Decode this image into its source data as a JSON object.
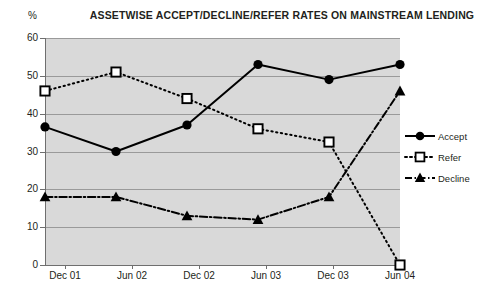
{
  "chart_data": {
    "type": "line",
    "title": "ASSETWISE ACCEPT/DECLINE/REFER RATES ON MAINSTREAM LENDING",
    "xlabel": "",
    "ylabel": "%",
    "categories": [
      "Dec 01",
      "Jun 02",
      "Dec 02",
      "Jun 03",
      "Dec 03",
      "Jun 04"
    ],
    "ylim": [
      0,
      60
    ],
    "ytick_labels": [
      "0",
      "10",
      "20",
      "30",
      "40",
      "50",
      "60"
    ],
    "ytick_values": [
      0,
      10,
      20,
      30,
      40,
      50,
      60
    ],
    "grid": true,
    "legend_position": "right",
    "series": [
      {
        "name": "Accept",
        "values": [
          36.5,
          30,
          37,
          53,
          49,
          53
        ],
        "marker": "filled-circle",
        "line_style": "solid",
        "color": "#000000"
      },
      {
        "name": "Refer",
        "values": [
          46,
          51,
          44,
          36,
          32.5,
          0
        ],
        "marker": "open-square",
        "line_style": "dotted",
        "color": "#000000"
      },
      {
        "name": "Decline",
        "values": [
          18,
          18,
          13,
          12,
          18,
          46
        ],
        "marker": "filled-triangle",
        "line_style": "dash-dot",
        "color": "#000000"
      }
    ],
    "plot_background": "#d9d9d9",
    "gridline_color": "#9a9a9a",
    "page_background": "#ffffff"
  }
}
